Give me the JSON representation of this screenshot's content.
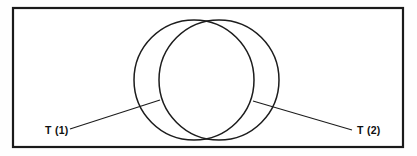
{
  "figure": {
    "background_color": "#fefefe",
    "line_color": "#1c1c1c",
    "frame": {
      "name": "outer-border",
      "x": 13,
      "y": 8,
      "width": 390,
      "height": 139,
      "stroke_width": 2.2
    },
    "circles": [
      {
        "name": "left-circle",
        "label_ref": "T (1)",
        "cx": 194,
        "cy": 80,
        "r": 60
      },
      {
        "name": "right-circle",
        "label_ref": "T (2)",
        "cx": 219,
        "cy": 80,
        "r": 60
      }
    ],
    "labels": [
      {
        "id": "label-t1",
        "text": "T (1)",
        "x": 45,
        "y": 134,
        "anchor": "start",
        "leader": {
          "x1": 70,
          "y1": 129,
          "x2": 160,
          "y2": 100
        }
      },
      {
        "id": "label-t2",
        "text": "T (2)",
        "x": 357,
        "y": 134,
        "anchor": "start",
        "leader": {
          "x1": 253,
          "y1": 101,
          "x2": 352,
          "y2": 130
        }
      }
    ]
  }
}
